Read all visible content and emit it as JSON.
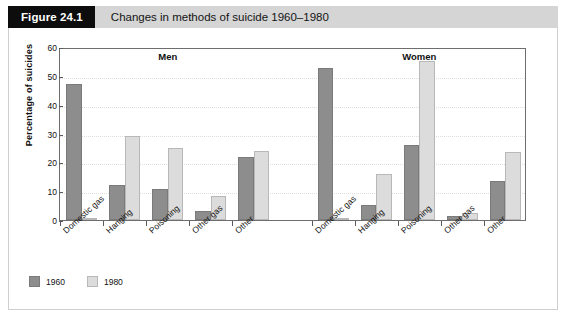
{
  "figure": {
    "number_label": "Figure 24.1",
    "caption": "Changes in methods of suicide 1960–1980"
  },
  "chart_data": {
    "type": "bar",
    "title": "Changes in methods of suicide 1960–1980",
    "xlabel": "",
    "ylabel": "Percentage of suicides",
    "ylim": [
      0,
      60
    ],
    "yticks": [
      0,
      10,
      20,
      30,
      40,
      50,
      60
    ],
    "grid": true,
    "legend_position": "bottom-left",
    "panels": [
      {
        "name": "Men",
        "categories": [
          "Domestic gas",
          "Hanging",
          "Poisoning",
          "Other gas",
          "Other"
        ],
        "series": [
          {
            "name": "1960",
            "color": "#8d8d8d",
            "values": [
              47.2,
              12.1,
              10.7,
              3.0,
              21.7
            ]
          },
          {
            "name": "1980",
            "color": "#dcdcdc",
            "values": [
              0.3,
              29.0,
              25.0,
              8.2,
              24.1
            ]
          }
        ]
      },
      {
        "name": "Women",
        "categories": [
          "Domestic gas",
          "Hanging",
          "Poisoning",
          "Other gas",
          "Other"
        ],
        "series": [
          {
            "name": "1960",
            "color": "#8d8d8d",
            "values": [
              52.8,
              5.2,
              25.9,
              1.5,
              13.5
            ]
          },
          {
            "name": "1980",
            "color": "#dcdcdc",
            "values": [
              0.2,
              15.8,
              55.0,
              2.5,
              23.7
            ]
          }
        ]
      }
    ],
    "legend": [
      {
        "label": "1960",
        "color": "#8d8d8d"
      },
      {
        "label": "1980",
        "color": "#dcdcdc"
      }
    ]
  }
}
